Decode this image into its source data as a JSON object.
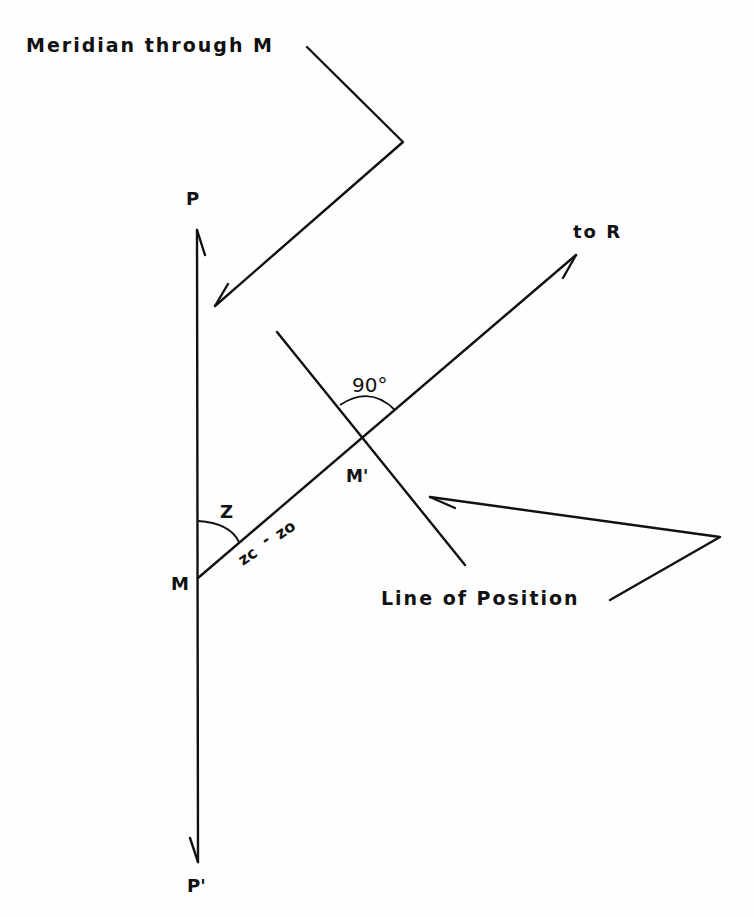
{
  "diagram": {
    "labels": {
      "meridian": "Meridian through M",
      "p": "P",
      "p_prime": "P'",
      "m": "M",
      "m_prime": "M'",
      "to_r": "to R",
      "angle_90": "90°",
      "z": "Z",
      "zc_z0_a": "zc",
      "zc_z0_b": "-",
      "zc_z0_c": "zo",
      "line_of_position": "Line of Position"
    }
  }
}
